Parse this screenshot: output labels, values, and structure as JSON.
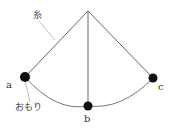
{
  "diagram": {
    "title": "",
    "labels": {
      "string": "糸",
      "weight": "おもり",
      "a": "a",
      "b": "b",
      "c": "c"
    },
    "colors": {
      "line": "#555555",
      "bob": "#111111",
      "leader": "#aaaaaa"
    }
  }
}
